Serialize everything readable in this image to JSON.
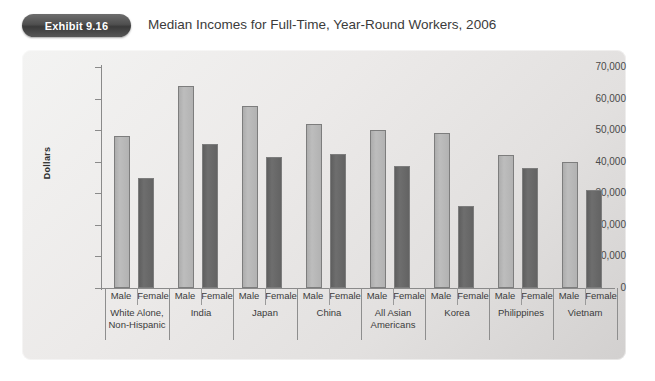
{
  "header": {
    "badge": "Exhibit 9.16",
    "title": "Median Incomes for Full-Time, Year-Round Workers, 2006"
  },
  "colors": {
    "bar_male": "#b2b2b2",
    "bar_female": "#646464",
    "bar_border": "#7d7d7d",
    "panel_bg": "#e8e6e5",
    "axis": "#8a8a8a",
    "badge_bg": "#4f4f4f",
    "text": "#3b3b3b"
  },
  "chart_data": {
    "type": "bar",
    "title": "Median Incomes for Full-Time, Year-Round Workers, 2006",
    "xlabel": "",
    "ylabel": "Dollars",
    "ylim": [
      0,
      70000
    ],
    "ytick_labels": [
      "70,000",
      "60,000",
      "50,000",
      "40,000",
      "30,000",
      "20,000",
      "10,000",
      "0"
    ],
    "ytick_values": [
      70000,
      60000,
      50000,
      40000,
      30000,
      20000,
      10000,
      0
    ],
    "grid": false,
    "legend": "none",
    "subcategories": [
      "Male",
      "Female"
    ],
    "categories": [
      "White Alone, Non-Hispanic",
      "India",
      "Japan",
      "China",
      "All Asian Americans",
      "Korea",
      "Philippines",
      "Vietnam"
    ],
    "category_lines": [
      [
        "White Alone,",
        "Non-Hispanic"
      ],
      [
        "India"
      ],
      [
        "Japan"
      ],
      [
        "China"
      ],
      [
        "All Asian",
        "Americans"
      ],
      [
        "Korea"
      ],
      [
        "Philippines"
      ],
      [
        "Vietnam"
      ]
    ],
    "series": [
      {
        "name": "Male",
        "values": [
          48000,
          64000,
          57500,
          52000,
          50000,
          49000,
          42000,
          40000
        ]
      },
      {
        "name": "Female",
        "values": [
          35000,
          45500,
          41500,
          42500,
          38500,
          26000,
          38000,
          31000
        ]
      }
    ]
  }
}
